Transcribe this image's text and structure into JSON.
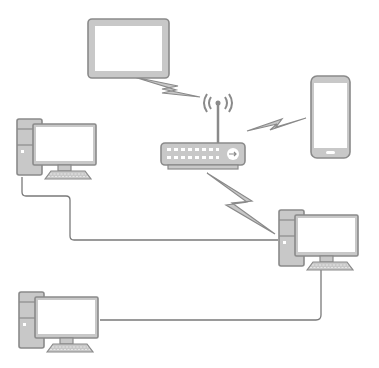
{
  "diagram": {
    "title": "Home network diagram",
    "colors": {
      "outline": "#8a8a8a",
      "fill": "#c8c8c8",
      "screen": "#ffffff",
      "cable": "#7a7a7a",
      "background": "#ffffff"
    },
    "nodes": [
      {
        "id": "tablet",
        "label": "Tablet",
        "icon": "tablet-icon"
      },
      {
        "id": "router",
        "label": "Wireless router",
        "icon": "router-icon"
      },
      {
        "id": "phone",
        "label": "Smartphone",
        "icon": "smartphone-icon"
      },
      {
        "id": "desktop-1",
        "label": "Desktop computer (top left)",
        "icon": "desktop-computer-icon"
      },
      {
        "id": "desktop-2",
        "label": "Desktop computer (right)",
        "icon": "desktop-computer-icon"
      },
      {
        "id": "desktop-3",
        "label": "Desktop computer (bottom left)",
        "icon": "desktop-computer-icon"
      }
    ],
    "links": [
      {
        "from": "tablet",
        "to": "router",
        "type": "wireless"
      },
      {
        "from": "phone",
        "to": "router",
        "type": "wireless"
      },
      {
        "from": "router",
        "to": "desktop-2",
        "type": "wireless"
      },
      {
        "from": "desktop-1",
        "to": "desktop-2",
        "type": "wired"
      },
      {
        "from": "desktop-3",
        "to": "desktop-2",
        "type": "wired"
      }
    ]
  }
}
